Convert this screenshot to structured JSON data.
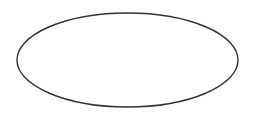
{
  "diagram": {
    "canvas": {
      "width": 253,
      "height": 117,
      "background": "#ffffff"
    },
    "shapes": [
      {
        "type": "ellipse",
        "cx": 127.5,
        "cy": 60,
        "rx": 110.5,
        "ry": 47,
        "fill": "#ffffff",
        "stroke": "#333333",
        "stroke_width": 1.4,
        "label": ""
      }
    ]
  }
}
